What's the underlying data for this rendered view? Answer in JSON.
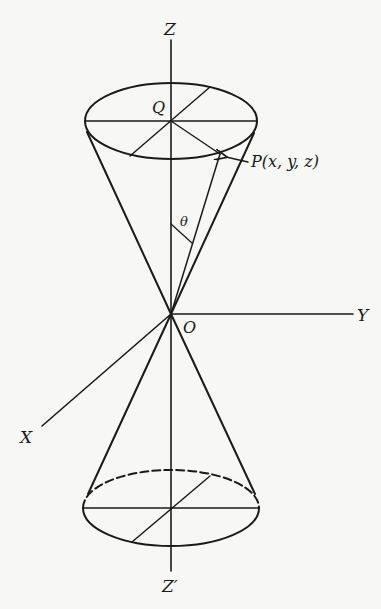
{
  "diagram": {
    "type": "double-cone-in-3d-axes",
    "colors": {
      "background": "#f7f7f5",
      "ink": "#1a1a1a"
    },
    "labels": {
      "z_axis": "Z",
      "z_axis_negative": "Z′",
      "y_axis": "Y",
      "x_axis": "X",
      "origin": "O",
      "center_top": "Q",
      "point": "P(x, y, z)",
      "angle": "θ"
    },
    "elements": {
      "top_base": "solid ellipse centered at Q with diameters through Q",
      "bottom_base": "ellipse with dashed hidden back half",
      "generator": "line from O to P with angle θ to Z axis",
      "arrow": "arrow pointing from label to P"
    }
  }
}
